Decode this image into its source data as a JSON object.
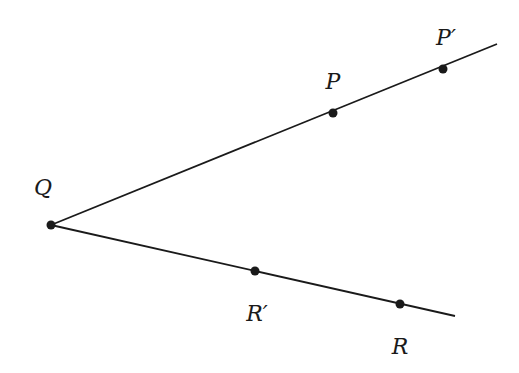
{
  "diagram": {
    "type": "geometry",
    "colors": {
      "stroke": "#1a1a1a",
      "point": "#1a1a1a",
      "background": "#ffffff"
    },
    "rays": [
      {
        "name": "ray-QP",
        "from": [
          51,
          225
        ],
        "to": [
          497,
          44
        ]
      },
      {
        "name": "ray-QR",
        "from": [
          51,
          225
        ],
        "to": [
          455,
          316
        ]
      }
    ],
    "points": [
      {
        "name": "Q",
        "label": "Q",
        "x": 51,
        "y": 225,
        "lx": 43,
        "ly": 195
      },
      {
        "name": "P",
        "label": "P",
        "x": 333,
        "y": 113,
        "lx": 333,
        "ly": 89
      },
      {
        "name": "P-prime",
        "label": "P′",
        "x": 443,
        "y": 69,
        "lx": 446,
        "ly": 45
      },
      {
        "name": "R-prime",
        "label": "R′",
        "x": 255,
        "y": 271,
        "lx": 257,
        "ly": 321
      },
      {
        "name": "R",
        "label": "R",
        "x": 400,
        "y": 304,
        "lx": 400,
        "ly": 354
      }
    ]
  }
}
